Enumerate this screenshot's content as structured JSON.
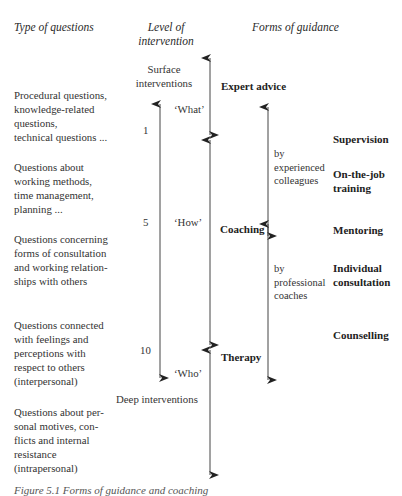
{
  "headers": {
    "type_of_questions": "Type of questions",
    "level_of_intervention_1": "Level of",
    "level_of_intervention_2": "intervention",
    "forms_of_guidance": "Forms of guidance"
  },
  "questions": [
    {
      "lines": [
        "Procedural questions,",
        "knowledge-related",
        "questions,",
        "technical questions ..."
      ]
    },
    {
      "lines": [
        "Questions about",
        "working methods,",
        "time management,",
        "planning ..."
      ]
    },
    {
      "lines": [
        "Questions concerning",
        "forms of consultation",
        "and working relation-",
        "ships with others"
      ]
    },
    {
      "lines": [
        "Questions connected",
        "with feelings and",
        "perceptions with",
        "respect to others",
        "(interpersonal)"
      ]
    },
    {
      "lines": [
        "Questions about per-",
        "sonal motives, con-",
        "flicts and internal",
        "resistance",
        "(intrapersonal)"
      ]
    }
  ],
  "levels": {
    "surface_1": "Surface",
    "surface_2": "interventions",
    "deep": "Deep interventions",
    "scale": [
      "1",
      "5",
      "10"
    ],
    "what": "‘What’",
    "how": "‘How’",
    "who": "‘Who’"
  },
  "guidance": {
    "expert_advice": "Expert advice",
    "coaching": "Coaching",
    "therapy": "Therapy",
    "by_experienced": [
      "by",
      "experienced",
      "colleagues"
    ],
    "by_professional": [
      "by",
      "professional",
      "coaches"
    ],
    "forms": [
      {
        "lines": [
          "Supervision"
        ]
      },
      {
        "lines": [
          "On-the-job",
          "training"
        ]
      },
      {
        "lines": [
          "Mentoring"
        ]
      },
      {
        "lines": [
          "Individual",
          "consultation"
        ]
      },
      {
        "lines": [
          "Counselling"
        ]
      }
    ]
  },
  "caption": "Figure 5.1 Forms of guidance and coaching"
}
